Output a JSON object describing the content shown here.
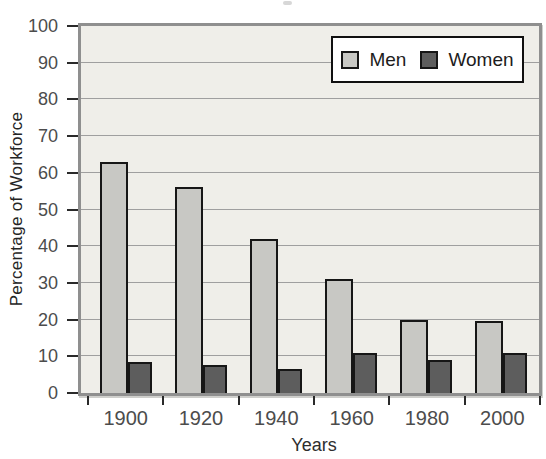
{
  "chart_data": {
    "type": "bar",
    "categories": [
      "1900",
      "1920",
      "1940",
      "1960",
      "1980",
      "2000"
    ],
    "series": [
      {
        "name": "Men",
        "color": "#c8c8c4",
        "values": [
          63,
          56,
          42,
          31,
          20,
          19.5
        ]
      },
      {
        "name": "Women",
        "color": "#5d5d5d",
        "values": [
          8.5,
          7.5,
          6.5,
          11,
          9,
          11
        ]
      }
    ],
    "title": "",
    "xlabel": "Years",
    "ylabel": "Percentage of Workforce",
    "ylim": [
      0,
      100
    ],
    "yticks": [
      0,
      10,
      20,
      30,
      40,
      50,
      60,
      70,
      80,
      90,
      100
    ],
    "grid": "horizontal",
    "legend_position": "top-right",
    "plot_bg": "#efeee9",
    "bar_outline": "#161616",
    "frame_color": "#8f8f8f",
    "gridline_color": "#9f9f9f",
    "axis_text_color": "#4c4c4c"
  }
}
